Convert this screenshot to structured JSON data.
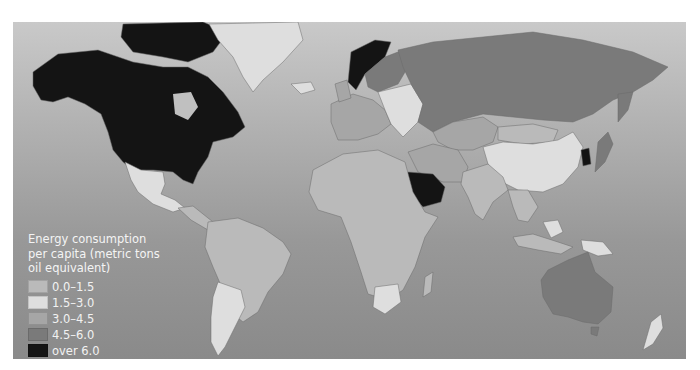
{
  "map": {
    "title": "Energy consumption per capita (metric tons oil equivalent)",
    "projection": "world",
    "colors": {
      "ocean_top": "#c9c9c9",
      "ocean_bottom": "#8a8a8a"
    }
  },
  "legend": {
    "title_lines": [
      "Energy consumption",
      "per capita (metric tons",
      "oil equivalent)"
    ],
    "items": [
      {
        "label": "0.0–1.5",
        "color": "#bababa"
      },
      {
        "label": "1.5–3.0",
        "color": "#dedede"
      },
      {
        "label": "3.0–4.5",
        "color": "#a6a6a6"
      },
      {
        "label": "4.5–6.0",
        "color": "#7a7a7a"
      },
      {
        "label": "over 6.0",
        "color": "#141414"
      }
    ]
  },
  "regions": [
    {
      "name": "North America (USA, Canada)",
      "class": "over 6.0"
    },
    {
      "name": "Greenland",
      "class": "1.5–3.0"
    },
    {
      "name": "Mexico",
      "class": "1.5–3.0"
    },
    {
      "name": "Central America",
      "class": "0.0–1.5"
    },
    {
      "name": "South America",
      "class": "0.0–1.5"
    },
    {
      "name": "Southern South America",
      "class": "1.5–3.0"
    },
    {
      "name": "Africa",
      "class": "0.0–1.5"
    },
    {
      "name": "South Africa",
      "class": "1.5–3.0"
    },
    {
      "name": "Western Europe",
      "class": "3.0–4.5"
    },
    {
      "name": "Norway",
      "class": "over 6.0"
    },
    {
      "name": "Eastern Europe",
      "class": "1.5–3.0"
    },
    {
      "name": "Russia",
      "class": "4.5–6.0"
    },
    {
      "name": "Saudi Arabia",
      "class": "over 6.0"
    },
    {
      "name": "China",
      "class": "1.5–3.0"
    },
    {
      "name": "India",
      "class": "0.0–1.5"
    },
    {
      "name": "Australia",
      "class": "4.5–6.0"
    },
    {
      "name": "New Zealand",
      "class": "1.5–3.0"
    }
  ]
}
